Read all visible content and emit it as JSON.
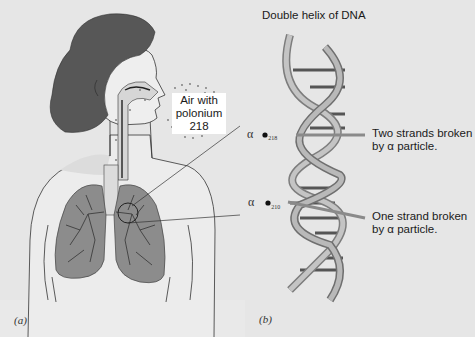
{
  "figure": {
    "title": "Double helix of DNA",
    "panels": [
      {
        "id": "a",
        "label": "(a)"
      },
      {
        "id": "b",
        "label": "(b)"
      }
    ],
    "callouts": {
      "air_label_line1": "Air with",
      "air_label_line2": "polonium",
      "air_label_line3": "218",
      "two_strands_line1": "Two strands broken",
      "two_strands_line2": "by α particle.",
      "one_strand_line1": "One strand broken",
      "one_strand_line2": "by α particle."
    },
    "particles": [
      {
        "symbol": "α",
        "subscript": "218"
      },
      {
        "symbol": "α",
        "subscript": "210"
      }
    ],
    "colors": {
      "background": "#e6e6e6",
      "hair": "#555555",
      "lung": "#8a8a8a",
      "helix": "#b0b0b0",
      "text": "#1a1a1a"
    }
  }
}
